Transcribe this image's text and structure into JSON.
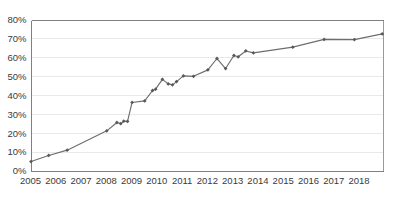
{
  "chart_data": {
    "type": "line",
    "title": "",
    "subtitle": "",
    "xlabel": "",
    "ylabel": "",
    "xlim": [
      2005.0,
      2018.95
    ],
    "ylim": [
      0,
      80
    ],
    "grid": true,
    "legend": false,
    "legend_position": "none",
    "y_tick_labels": [
      "0%",
      "10%",
      "20%",
      "30%",
      "40%",
      "50%",
      "60%",
      "70%",
      "80%"
    ],
    "y_tick_values": [
      0,
      10,
      20,
      30,
      40,
      50,
      60,
      70,
      80
    ],
    "x_tick_labels": [
      "2005",
      "2006",
      "2007",
      "2008",
      "2009",
      "2010",
      "2011",
      "2012",
      "2013",
      "2014",
      "2015",
      "2016",
      "2017",
      "2018"
    ],
    "x_tick_values": [
      2005,
      2006,
      2007,
      2008,
      2009,
      2010,
      2011,
      2012,
      2013,
      2014,
      2015,
      2016,
      2017,
      2018
    ],
    "marker": "diamond",
    "line_color": "#6e6e6e",
    "marker_color": "#595959",
    "grid_color": "#e9e9e9",
    "axis_color": "#808080",
    "background_color": "#ffffff",
    "series": [
      {
        "name": "Series 1",
        "x": [
          2005.02,
          2005.72,
          2006.45,
          2008.02,
          2008.42,
          2008.57,
          2008.69,
          2008.84,
          2009.02,
          2009.52,
          2009.83,
          2009.95,
          2010.22,
          2010.45,
          2010.62,
          2010.78,
          2011.05,
          2011.45,
          2012.02,
          2012.38,
          2012.72,
          2013.05,
          2013.22,
          2013.52,
          2013.82,
          2015.38,
          2016.62,
          2017.82,
          2018.92
        ],
        "y": [
          5.0,
          8.2,
          11.0,
          21.2,
          25.6,
          25.0,
          26.3,
          26.2,
          36.2,
          37.0,
          42.5,
          43.2,
          48.4,
          46.0,
          45.5,
          47.2,
          50.2,
          50.0,
          53.4,
          59.4,
          54.1,
          61.0,
          60.3,
          63.4,
          62.4,
          65.4,
          69.5,
          69.4,
          72.4
        ]
      }
    ]
  }
}
